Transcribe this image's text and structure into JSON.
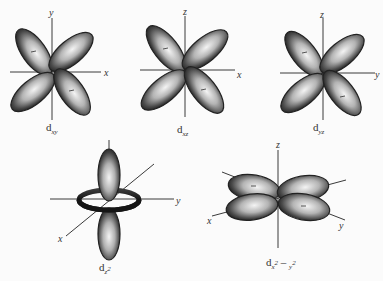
{
  "colors": {
    "background": "#fbfbfb",
    "lobe_dark": "#1e1e1e",
    "lobe_light": "#f2f2f2",
    "axis": "#3a3a3a"
  },
  "orbitals": [
    {
      "id": "dxy",
      "caption_main": "d",
      "caption_sub": "xy",
      "horizontal_axis": "x",
      "vertical_axis": "y",
      "lobe_orientation": "diagonal between axes",
      "negative_signs": [
        "upper-left",
        "lower-right"
      ],
      "sign_symbol": "–"
    },
    {
      "id": "dxz",
      "caption_main": "d",
      "caption_sub": "xz",
      "horizontal_axis": "x",
      "vertical_axis": "z",
      "lobe_orientation": "diagonal between axes",
      "negative_signs": [
        "upper-left",
        "lower-right"
      ],
      "sign_symbol": "–"
    },
    {
      "id": "dyz",
      "caption_main": "d",
      "caption_sub": "yz",
      "horizontal_axis": "y",
      "vertical_axis": "z",
      "lobe_orientation": "diagonal between axes",
      "negative_signs": [
        "upper-left",
        "lower-right"
      ],
      "sign_symbol": "–"
    },
    {
      "id": "dz2",
      "caption_main": "d",
      "caption_sub": "z",
      "caption_sup": "2",
      "axes": [
        "z",
        "y",
        "x"
      ],
      "lobe_orientation": "two lobes along z with torus in xy-plane"
    },
    {
      "id": "dx2-y2",
      "caption_main": "d",
      "caption_sub": "x",
      "caption_sup": "2",
      "caption_mid": " – ",
      "caption_sub2": "y",
      "caption_sup2": "2",
      "axes": [
        "z",
        "x",
        "y"
      ],
      "lobe_orientation": "along x and y axes",
      "negative_signs": [
        "back-left",
        "front-right"
      ],
      "sign_symbol": "–"
    }
  ]
}
